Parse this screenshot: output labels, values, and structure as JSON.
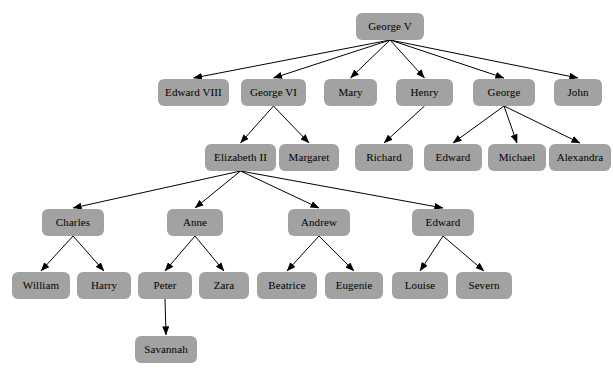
{
  "diagram": {
    "type": "family-tree",
    "node_color": "#a2a2a2",
    "edge_color": "#000000",
    "background_color": "#ffffff",
    "nodes": [
      {
        "id": "george_v",
        "label": "George V",
        "x": 356,
        "y": 13,
        "w": 68,
        "h": 27,
        "row": 0
      },
      {
        "id": "edward_viii",
        "label": "Edward VIII",
        "x": 158,
        "y": 79,
        "w": 71,
        "h": 27,
        "row": 1
      },
      {
        "id": "george_vi",
        "label": "George VI",
        "x": 241,
        "y": 79,
        "w": 65,
        "h": 27,
        "row": 1
      },
      {
        "id": "mary",
        "label": "Mary",
        "x": 324,
        "y": 79,
        "w": 53,
        "h": 27,
        "row": 1
      },
      {
        "id": "henry",
        "label": "Henry",
        "x": 396,
        "y": 79,
        "w": 57,
        "h": 27,
        "row": 1
      },
      {
        "id": "george",
        "label": "George",
        "x": 473,
        "y": 79,
        "w": 62,
        "h": 27,
        "row": 1
      },
      {
        "id": "john",
        "label": "John",
        "x": 554,
        "y": 79,
        "w": 48,
        "h": 27,
        "row": 1
      },
      {
        "id": "elizabeth_ii",
        "label": "Elizabeth II",
        "x": 205,
        "y": 144,
        "w": 71,
        "h": 27,
        "row": 2
      },
      {
        "id": "margaret",
        "label": "Margaret",
        "x": 279,
        "y": 144,
        "w": 60,
        "h": 27,
        "row": 2
      },
      {
        "id": "richard",
        "label": "Richard",
        "x": 355,
        "y": 144,
        "w": 58,
        "h": 27,
        "row": 2
      },
      {
        "id": "edward_g",
        "label": "Edward",
        "x": 424,
        "y": 144,
        "w": 58,
        "h": 27,
        "row": 2
      },
      {
        "id": "michael",
        "label": "Michael",
        "x": 488,
        "y": 144,
        "w": 58,
        "h": 27,
        "row": 2
      },
      {
        "id": "alexandra",
        "label": "Alexandra",
        "x": 549,
        "y": 144,
        "w": 62,
        "h": 27,
        "row": 2
      },
      {
        "id": "charles",
        "label": "Charles",
        "x": 42,
        "y": 209,
        "w": 62,
        "h": 27,
        "row": 3
      },
      {
        "id": "anne",
        "label": "Anne",
        "x": 167,
        "y": 209,
        "w": 56,
        "h": 27,
        "row": 3
      },
      {
        "id": "andrew",
        "label": "Andrew",
        "x": 288,
        "y": 209,
        "w": 62,
        "h": 27,
        "row": 3
      },
      {
        "id": "edward_e",
        "label": "Edward",
        "x": 412,
        "y": 209,
        "w": 62,
        "h": 27,
        "row": 3
      },
      {
        "id": "william",
        "label": "William",
        "x": 12,
        "y": 272,
        "w": 58,
        "h": 27,
        "row": 4
      },
      {
        "id": "harry",
        "label": "Harry",
        "x": 77,
        "y": 272,
        "w": 54,
        "h": 27,
        "row": 4
      },
      {
        "id": "peter",
        "label": "Peter",
        "x": 138,
        "y": 272,
        "w": 54,
        "h": 27,
        "row": 4
      },
      {
        "id": "zara",
        "label": "Zara",
        "x": 199,
        "y": 272,
        "w": 50,
        "h": 27,
        "row": 4
      },
      {
        "id": "beatrice",
        "label": "Beatrice",
        "x": 257,
        "y": 272,
        "w": 60,
        "h": 27,
        "row": 4
      },
      {
        "id": "eugenie",
        "label": "Eugenie",
        "x": 325,
        "y": 272,
        "w": 58,
        "h": 27,
        "row": 4
      },
      {
        "id": "louise",
        "label": "Louise",
        "x": 392,
        "y": 272,
        "w": 56,
        "h": 27,
        "row": 4
      },
      {
        "id": "severn",
        "label": "Severn",
        "x": 456,
        "y": 272,
        "w": 56,
        "h": 27,
        "row": 4
      },
      {
        "id": "savannah",
        "label": "Savannah",
        "x": 135,
        "y": 336,
        "w": 62,
        "h": 27,
        "row": 5
      }
    ],
    "edges": [
      {
        "from": "george_v",
        "to": "edward_viii"
      },
      {
        "from": "george_v",
        "to": "george_vi"
      },
      {
        "from": "george_v",
        "to": "mary"
      },
      {
        "from": "george_v",
        "to": "henry"
      },
      {
        "from": "george_v",
        "to": "george"
      },
      {
        "from": "george_v",
        "to": "john"
      },
      {
        "from": "george_vi",
        "to": "elizabeth_ii"
      },
      {
        "from": "george_vi",
        "to": "margaret"
      },
      {
        "from": "henry",
        "to": "richard"
      },
      {
        "from": "george",
        "to": "edward_g"
      },
      {
        "from": "george",
        "to": "michael"
      },
      {
        "from": "george",
        "to": "alexandra"
      },
      {
        "from": "elizabeth_ii",
        "to": "charles"
      },
      {
        "from": "elizabeth_ii",
        "to": "anne"
      },
      {
        "from": "elizabeth_ii",
        "to": "andrew"
      },
      {
        "from": "elizabeth_ii",
        "to": "edward_e"
      },
      {
        "from": "charles",
        "to": "william"
      },
      {
        "from": "charles",
        "to": "harry"
      },
      {
        "from": "anne",
        "to": "peter"
      },
      {
        "from": "anne",
        "to": "zara"
      },
      {
        "from": "andrew",
        "to": "beatrice"
      },
      {
        "from": "andrew",
        "to": "eugenie"
      },
      {
        "from": "edward_e",
        "to": "louise"
      },
      {
        "from": "edward_e",
        "to": "severn"
      },
      {
        "from": "peter",
        "to": "savannah"
      }
    ]
  }
}
